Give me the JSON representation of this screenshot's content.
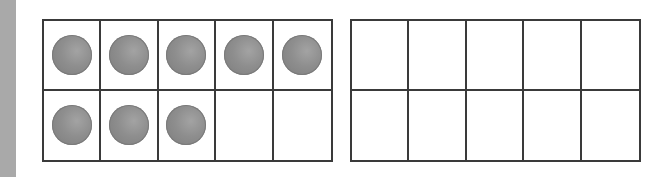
{
  "worksheet": {
    "side_bar_color": "#a9a9a9",
    "frames": [
      {
        "name": "ten-frame-1",
        "rows": 2,
        "cols": 5,
        "filled_count": 8,
        "cells": [
          true,
          true,
          true,
          true,
          true,
          true,
          true,
          true,
          false,
          false
        ]
      },
      {
        "name": "ten-frame-2",
        "rows": 2,
        "cols": 5,
        "filled_count": 0,
        "cells": [
          false,
          false,
          false,
          false,
          false,
          false,
          false,
          false,
          false,
          false
        ]
      }
    ],
    "counter_color": "#8a8a8a",
    "grid_line_color": "#3a3a3a"
  }
}
